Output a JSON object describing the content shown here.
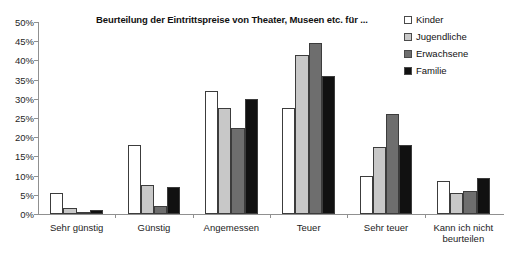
{
  "chart_data": {
    "type": "bar",
    "title": "Beurteilung der Eintrittspreise von Theater, Museen etc. für ...",
    "xlabel": "",
    "ylabel": "",
    "ylim": [
      0,
      50
    ],
    "ytick_labels": [
      "0%",
      "5%",
      "10%",
      "15%",
      "20%",
      "25%",
      "30%",
      "35%",
      "40%",
      "45%",
      "50%"
    ],
    "ytick_values": [
      0,
      5,
      10,
      15,
      20,
      25,
      30,
      35,
      40,
      45,
      50
    ],
    "grid": false,
    "legend_position": "top-right",
    "categories": [
      "Sehr günstig",
      "Günstig",
      "Angemessen",
      "Teuer",
      "Sehr teuer",
      "Kann ich nicht beurteilen"
    ],
    "series": [
      {
        "name": "Kinder",
        "color": "#ffffff",
        "values": [
          5.5,
          18.0,
          32.0,
          27.5,
          10.0,
          8.5
        ]
      },
      {
        "name": "Jugendliche",
        "color": "#c8c8c8",
        "values": [
          1.5,
          7.5,
          27.5,
          41.5,
          17.5,
          5.5
        ]
      },
      {
        "name": "Erwachsene",
        "color": "#6e6e6e",
        "values": [
          0.5,
          2.0,
          22.5,
          44.5,
          26.0,
          6.0
        ]
      },
      {
        "name": "Familie",
        "color": "#111111",
        "values": [
          1.0,
          7.0,
          30.0,
          36.0,
          18.0,
          9.5
        ]
      }
    ]
  }
}
